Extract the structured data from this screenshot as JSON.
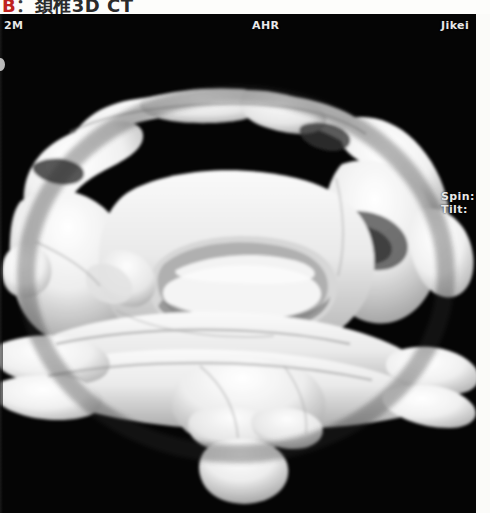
{
  "caption": {
    "label": "B",
    "separator": "：",
    "text": "頚椎3D CT"
  },
  "viewport": {
    "background_color": "#000000",
    "bone_color": "#f2f2f2",
    "overlay_text_color": "#e8e8e8"
  },
  "overlay": {
    "series_id": "2M",
    "institution": "AHR",
    "vendor": "Jikei",
    "spin_label": "Spin:",
    "tilt_label": "Tilt:"
  },
  "scan": {
    "modality": "3D CT volume rendering",
    "anatomy": "cervical spine",
    "view": "posterior oblique"
  }
}
